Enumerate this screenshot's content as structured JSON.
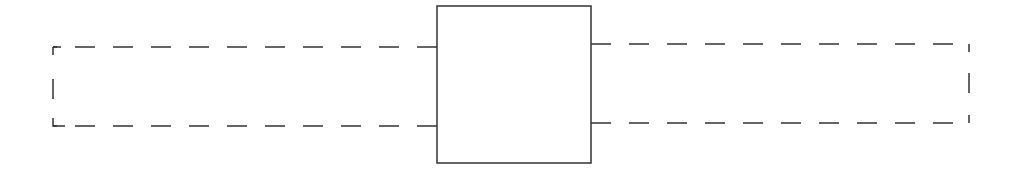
{
  "diagram": {
    "stroke_color": "#333333",
    "background": "#ffffff",
    "center_box": {
      "x": 437,
      "y": 6,
      "width": 154,
      "height": 157,
      "style": "solid"
    },
    "left_dashed": {
      "x1": 53,
      "x2": 437,
      "top": 47,
      "bottom": 126,
      "style": "dashed",
      "open_side": "right"
    },
    "right_dashed": {
      "x1": 591,
      "x2": 969,
      "top": 44,
      "bottom": 123,
      "style": "dashed",
      "open_side": "left"
    }
  }
}
